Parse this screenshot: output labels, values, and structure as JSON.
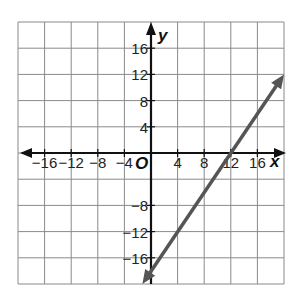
{
  "chart_data": {
    "type": "line",
    "title": "",
    "xlabel": "x",
    "ylabel": "y",
    "origin_label": "O",
    "xlim": [
      -20,
      20
    ],
    "ylim": [
      -20,
      20
    ],
    "grid": true,
    "grid_step": 4,
    "x_ticks": [
      "-16",
      "-12",
      "-8",
      "-4",
      "4",
      "8",
      "12",
      "16"
    ],
    "y_ticks": [
      "16",
      "12",
      "8",
      "4",
      "-8",
      "-12",
      "-16"
    ],
    "series": [
      {
        "name": "line",
        "equation": "y = 1.5x - 18",
        "x": [
          -1.3,
          20
        ],
        "y": [
          -20,
          12
        ],
        "passes_through": [
          [
            0,
            -18
          ],
          [
            12,
            0
          ],
          [
            20,
            12
          ]
        ],
        "color": "#555555",
        "arrows": "both"
      }
    ],
    "legend": null
  },
  "colors": {
    "grid": "#8a8a8a",
    "axes": "#111111",
    "line": "#555555"
  }
}
